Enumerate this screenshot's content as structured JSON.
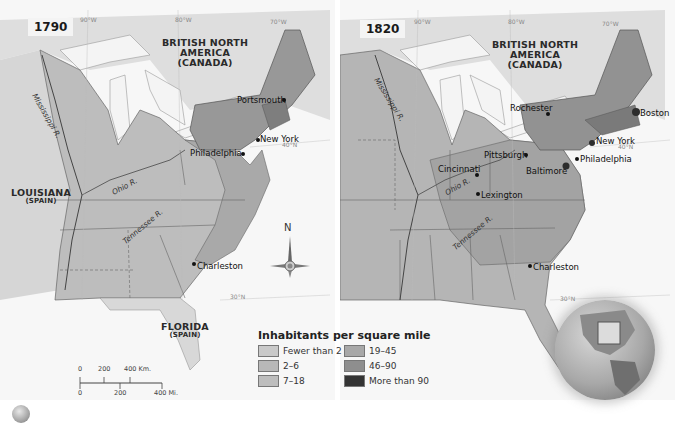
{
  "maps": [
    {
      "year": "1790",
      "regions": [
        {
          "name": "BRITISH NORTH AMERICA",
          "sub": "(CANADA)"
        },
        {
          "name": "LOUISIANA",
          "sub": "(SPAIN)"
        },
        {
          "name": "FLORIDA",
          "sub": "(SPAIN)"
        }
      ],
      "cities": [
        "Portsmouth",
        "New York",
        "Philadelphia",
        "Charleston"
      ],
      "rivers": [
        "Mississippi R.",
        "Ohio R.",
        "Tennessee R."
      ],
      "grid_labels": [
        "90°W",
        "80°W",
        "70°W",
        "40°N",
        "30°N"
      ]
    },
    {
      "year": "1820",
      "regions": [
        {
          "name": "BRITISH NORTH AMERICA",
          "sub": "(CANADA)"
        }
      ],
      "cities": [
        "Rochester",
        "Boston",
        "New York",
        "Pittsburgh",
        "Philadelphia",
        "Cincinnati",
        "Baltimore",
        "Lexington",
        "Charleston"
      ],
      "rivers": [
        "Mississippi R.",
        "Ohio R.",
        "Tennessee R."
      ],
      "grid_labels": [
        "90°W",
        "80°W",
        "70°W",
        "40°N",
        "30°N"
      ]
    }
  ],
  "legend": {
    "title": "Inhabitants per square mile",
    "items": [
      {
        "label": "Fewer than 2",
        "color": "#c9c9c9"
      },
      {
        "label": "2–6",
        "color": "#b8b8b8"
      },
      {
        "label": "7–18",
        "color": "#bdbdbd"
      },
      {
        "label": "19–45",
        "color": "#a8a8a8"
      },
      {
        "label": "46–90",
        "color": "#8e8e8e"
      },
      {
        "label": "More than 90",
        "color": "#333333"
      }
    ]
  },
  "scale_bar": {
    "km_ticks": [
      "0",
      "200",
      "400 Km."
    ],
    "mi_ticks": [
      "0",
      "200",
      "400 Mi."
    ]
  },
  "compass": {
    "north_label": "N"
  },
  "colors": {
    "water": "#f6f6f6",
    "land_foreign": "#dcdcdc",
    "us_sparse": "#b9b9b9",
    "us_mid": "#a6a6a6",
    "us_dense": "#8f8f8f",
    "border": "#555555"
  }
}
